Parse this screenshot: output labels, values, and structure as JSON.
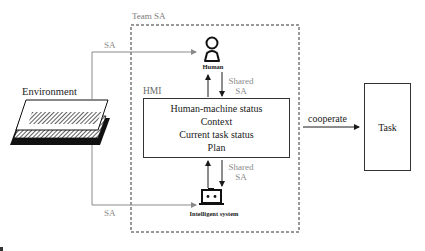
{
  "diagram": {
    "team_label": "Team SA",
    "environment": {
      "label": "Environment",
      "icon": "layered-parallelogram-icon"
    },
    "sa_links": {
      "to_human": "SA",
      "to_system": "SA"
    },
    "human": {
      "label": "Human",
      "icon": "person-icon"
    },
    "shared_sa_top": [
      "Shared",
      "SA"
    ],
    "shared_sa_bottom": [
      "Shared",
      "SA"
    ],
    "hmi": {
      "label": "HMI",
      "lines": [
        "Human-machine status",
        "Context",
        "Current task status",
        "Plan"
      ]
    },
    "intelligent_system": {
      "label": "Intelligent system",
      "icon": "robot-laptop-icon"
    },
    "cooperate": {
      "label": "cooperate"
    },
    "task": {
      "label": "Task"
    },
    "colors": {
      "line_dark": "#1a1a1a",
      "line_gray": "#8a8a8a",
      "text_gray": "#8a8a8a",
      "background": "#ffffff"
    }
  }
}
